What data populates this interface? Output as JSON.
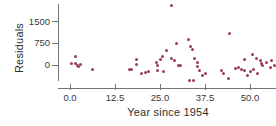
{
  "colors": {
    "marker": "#9a3e53",
    "axis": "#737476",
    "text": "#2f2f2f",
    "background": "#ffffff"
  },
  "chart_data": {
    "type": "scatter",
    "title": "",
    "xlabel": "Year since 1954",
    "ylabel": "Residuals",
    "x_tick_values": [
      0,
      12.5,
      25,
      37.5,
      50
    ],
    "x_tick_labels": [
      "0.0",
      "12.5",
      "25.0",
      "37.5",
      "50.0"
    ],
    "y_tick_values": [
      0,
      750,
      1500
    ],
    "y_tick_labels": [
      "0",
      "750",
      "1500"
    ],
    "xlim": [
      -3.3,
      57.2
    ],
    "ylim": [
      -800,
      2100
    ],
    "grid": false,
    "legend": "none",
    "points": [
      [
        0.3,
        60
      ],
      [
        1.5,
        290
      ],
      [
        1.6,
        60
      ],
      [
        2.1,
        0
      ],
      [
        2.4,
        -60
      ],
      [
        2.8,
        30
      ],
      [
        6.2,
        -150
      ],
      [
        16.4,
        -140
      ],
      [
        17.2,
        -150
      ],
      [
        18.5,
        180
      ],
      [
        18.6,
        30
      ],
      [
        19.8,
        -280
      ],
      [
        20.9,
        -270
      ],
      [
        21.8,
        -230
      ],
      [
        23.9,
        70
      ],
      [
        24.2,
        -175
      ],
      [
        24.4,
        0
      ],
      [
        25.0,
        175
      ],
      [
        25.8,
        280
      ],
      [
        26.1,
        -210
      ],
      [
        26.9,
        490
      ],
      [
        28.3,
        2060
      ],
      [
        28.3,
        210
      ],
      [
        28.9,
        140
      ],
      [
        29.7,
        760
      ],
      [
        30.0,
        0
      ],
      [
        30.8,
        -20
      ],
      [
        32.8,
        870
      ],
      [
        33.3,
        -520
      ],
      [
        33.6,
        630
      ],
      [
        33.9,
        520
      ],
      [
        34.4,
        -550
      ],
      [
        34.7,
        210
      ],
      [
        35.3,
        70
      ],
      [
        35.4,
        -40
      ],
      [
        36.1,
        -175
      ],
      [
        36.9,
        -380
      ],
      [
        37.5,
        -280
      ],
      [
        42.2,
        -175
      ],
      [
        42.5,
        -280
      ],
      [
        43.9,
        -450
      ],
      [
        44.2,
        1100
      ],
      [
        46.1,
        -105
      ],
      [
        46.7,
        -70
      ],
      [
        47.5,
        -140
      ],
      [
        48.6,
        175
      ],
      [
        48.6,
        -175
      ],
      [
        49.4,
        -350
      ],
      [
        50.0,
        -210
      ],
      [
        50.6,
        350
      ],
      [
        51.1,
        -140
      ],
      [
        51.7,
        210
      ],
      [
        52.2,
        -280
      ],
      [
        52.8,
        140
      ],
      [
        53.1,
        35
      ],
      [
        53.6,
        0
      ],
      [
        54.7,
        70
      ],
      [
        55.6,
        -70
      ],
      [
        56.1,
        140
      ],
      [
        56.7,
        -20
      ]
    ]
  }
}
